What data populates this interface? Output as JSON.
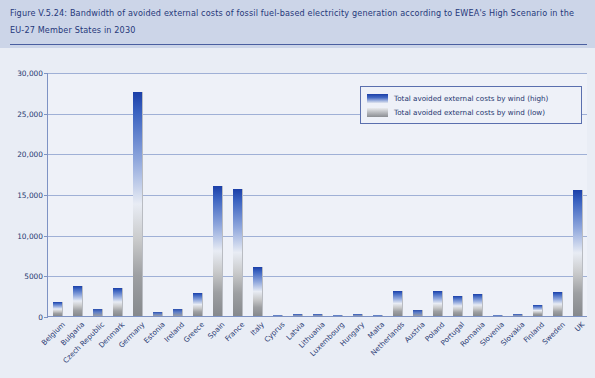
{
  "figure": {
    "title": "Figure V.5.24: Bandwidth of avoided external costs of fossil fuel-based electricity generation according to EWEA's High Scenario in the EU-27 Member States in 2030"
  },
  "legend": {
    "position": "top-right",
    "entries": [
      {
        "label": "Total avoided external costs by wind (high)",
        "swatch": "high"
      },
      {
        "label": "Total avoided external costs by wind (low)",
        "swatch": "low"
      }
    ]
  },
  "axes": {
    "ylabel_html": "Avoided external costs (€<sub>2007</sub>m/yr)",
    "ytick_labels": [
      "30,000",
      "25,000",
      "20,000",
      "15,000",
      "10,000",
      "5000",
      "0"
    ]
  },
  "colors": {
    "header_band": "#ccd5e8",
    "title_text": "#26387a",
    "plot_background": "#eef1f8",
    "page_background": "#e9edf5",
    "gridline": "#9fb0d6",
    "axis": "#7e93c4",
    "bar_high": "#1b3fa8",
    "bar_low": "#86898d",
    "legend_border": "#5a6fae"
  },
  "chart_data": {
    "type": "bar",
    "title": "Bandwidth of avoided external costs of fossil fuel-based electricity generation according to EWEA's High Scenario in the EU-27 Member States in 2030",
    "xlabel": "",
    "ylabel": "Avoided external costs (€2007m/yr)",
    "ylim": [
      0,
      30000
    ],
    "yticks": [
      0,
      5000,
      10000,
      15000,
      20000,
      25000,
      30000
    ],
    "grid": true,
    "note": "Each bar is a bandwidth: the top of the bar is the 'high' estimate and the gradient fades to the 'low' estimate toward the base.",
    "categories": [
      "Belgium",
      "Bulgaria",
      "Czech Republic",
      "Denmark",
      "Germany",
      "Estonia",
      "Ireland",
      "Greece",
      "Spain",
      "France",
      "Italy",
      "Cyprus",
      "Latvia",
      "Lithuania",
      "Luxembourg",
      "Hungary",
      "Malta",
      "Netherlands",
      "Austria",
      "Poland",
      "Portugal",
      "Romania",
      "Slovenia",
      "Slovakia",
      "Finland",
      "Sweden",
      "UK"
    ],
    "series": [
      {
        "name": "Total avoided external costs by wind (high)",
        "values": [
          1700,
          3700,
          900,
          3500,
          27500,
          500,
          900,
          2800,
          16000,
          15600,
          6000,
          150,
          200,
          200,
          100,
          250,
          80,
          3050,
          700,
          3100,
          2450,
          2700,
          150,
          250,
          1300,
          2900,
          15500
        ]
      },
      {
        "name": "Total avoided external costs by wind (low)",
        "values": [
          250,
          400,
          150,
          400,
          3200,
          60,
          120,
          350,
          1900,
          1850,
          700,
          20,
          25,
          25,
          15,
          30,
          10,
          360,
          90,
          370,
          290,
          320,
          20,
          30,
          160,
          350,
          1800
        ]
      }
    ]
  }
}
